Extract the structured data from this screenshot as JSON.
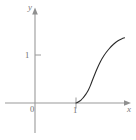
{
  "figure": {
    "name": "cartesian-graph",
    "background_color": "#ffffff",
    "width": 136,
    "height": 140
  },
  "axes": {
    "y_axis": {
      "label": "y",
      "label_style": "italic",
      "color": "#9a9a9a",
      "arrow": "up",
      "x_px": 35,
      "top_px": 8,
      "bottom_px": 133
    },
    "x_axis": {
      "label": "x",
      "label_style": "italic",
      "color": "#9a9a9a",
      "arrow": "right",
      "y_px": 103,
      "left_px": 5,
      "right_px": 131
    },
    "origin_label": "0"
  },
  "ticks": {
    "y": [
      {
        "label": "1",
        "value": 1,
        "y_px": 55
      }
    ],
    "x": [
      {
        "label": "1",
        "value": 1,
        "x_px": 76
      }
    ]
  },
  "chart_data": {
    "type": "line",
    "title": "",
    "subtitle": "",
    "xlabel": "x",
    "ylabel": "y",
    "grid": false,
    "legend": null,
    "xlim": [
      -1.0,
      2.2
    ],
    "ylim": [
      -0.7,
      2.3
    ],
    "annotations": [],
    "series": [
      {
        "name": "curve",
        "color": "#2b2b2b",
        "line_width": 1.1,
        "description": "steeply increasing curve starting at (1, 0), tangent to the x-axis, rising sharply toward a vertical asymptote",
        "x": [
          1.0,
          1.05,
          1.1,
          1.15,
          1.2,
          1.25,
          1.3,
          1.35,
          1.4,
          1.45,
          1.5,
          1.55,
          1.6,
          1.65,
          1.7,
          1.75,
          1.8,
          1.83
        ],
        "y": [
          0.0,
          0.02,
          0.05,
          0.09,
          0.14,
          0.2,
          0.27,
          0.36,
          0.47,
          0.6,
          0.75,
          0.92,
          1.12,
          1.33,
          1.55,
          1.76,
          1.93,
          2.0
        ],
        "points_px": [
          [
            76.0,
            103.0
          ],
          [
            77.5,
            102.5
          ],
          [
            79.0,
            101.6
          ],
          [
            80.5,
            100.5
          ],
          [
            82.0,
            99.1
          ],
          [
            83.5,
            97.4
          ],
          [
            85.0,
            95.5
          ],
          [
            86.5,
            93.3
          ],
          [
            88.0,
            90.7
          ],
          [
            89.5,
            87.6
          ],
          [
            91.0,
            84.1
          ],
          [
            92.5,
            80.0
          ],
          [
            94.5,
            75.1
          ],
          [
            96.5,
            70.0
          ],
          [
            99.0,
            64.5
          ],
          [
            102.0,
            58.5
          ],
          [
            106.0,
            52.5
          ],
          [
            111.0,
            46.5
          ],
          [
            116.0,
            42.0
          ],
          [
            120.0,
            39.5
          ],
          [
            123.0,
            38.3
          ],
          [
            124.5,
            37.8
          ]
        ]
      }
    ]
  }
}
